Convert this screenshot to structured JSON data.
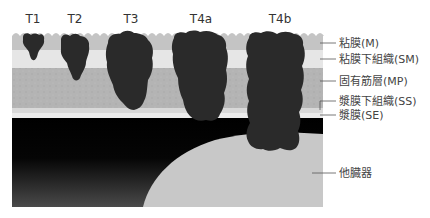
{
  "stages": [
    {
      "id": "T1",
      "label": "T1"
    },
    {
      "id": "T2",
      "label": "T2"
    },
    {
      "id": "T3",
      "label": "T3"
    },
    {
      "id": "T4a",
      "label": "T4a"
    },
    {
      "id": "T4b",
      "label": "T4b"
    }
  ],
  "layers": [
    {
      "id": "M",
      "label": "粘膜(M)"
    },
    {
      "id": "SM",
      "label": "粘膜下組織(SM)"
    },
    {
      "id": "MP",
      "label": "固有筋層(MP)"
    },
    {
      "id": "SS",
      "label": "漿膜下組織(SS)"
    },
    {
      "id": "SE",
      "label": "漿膜(SE)"
    },
    {
      "id": "other",
      "label": "他臓器"
    }
  ],
  "colors": {
    "mucosa": "#c4c4c4",
    "submucosa": "#e6e6e6",
    "muscularis": "#b4b4b4",
    "subserosa": "#d8d8d8",
    "serosa": "#ececec",
    "cavity": "#000000",
    "other_organ": "#c8c8c8",
    "tumor": "#2a2a2a"
  }
}
